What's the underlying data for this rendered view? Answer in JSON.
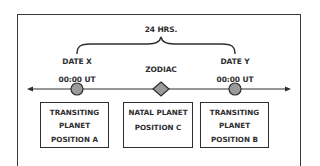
{
  "diagram": {
    "type": "timeline",
    "span_label": "24 HRS.",
    "center_label": "ZODIAC",
    "left_marker": {
      "date_label": "DATE X",
      "time_label": "00:00 UT",
      "shape": "circle"
    },
    "center_marker": {
      "shape": "diamond"
    },
    "right_marker": {
      "date_label": "DATE Y",
      "time_label": "00:00 UT",
      "shape": "circle"
    },
    "boxes": [
      {
        "lines": [
          "TRANSITING",
          "PLANET",
          "POSITION A"
        ]
      },
      {
        "lines": [
          "NATAL PLANET",
          "POSITION C"
        ]
      },
      {
        "lines": [
          "TRANSITING",
          "PLANET",
          "POSITION B"
        ]
      }
    ],
    "colors": {
      "marker_fill": "#9a9a9a",
      "line": "#2e2e2e",
      "text": "#2e2e2e",
      "background": "#ffffff"
    }
  }
}
